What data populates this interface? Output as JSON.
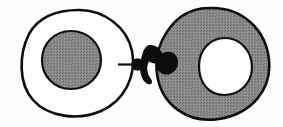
{
  "figure": {
    "title": "Two-cell conjugation diagram",
    "type": "line-drawing",
    "width": 283,
    "height": 127,
    "background_color": "#fdfdfd",
    "style": "black-ink outline drawing with dithered gray halftone fill",
    "caption": "",
    "labels": []
  },
  "colors": {
    "ink": "#1a1a1a",
    "stroke": "#111111",
    "gray_fill": "#808080",
    "gray_fill_light": "#8d8d8d",
    "white_fill": "#ffffff",
    "background": "#fdfdfd"
  },
  "shapes": {
    "left_cell": {
      "name": "left-cell-outline",
      "description": "irregular oval cell outline, white interior, thick black stroke",
      "fill": "#ffffff",
      "stroke": "#111111",
      "stroke_width": 2.6,
      "bbox": [
        22,
        9,
        113,
        107
      ],
      "path": "M 79 10 C 104 10 127 27 132 51 C 137 76 124 101 101 111 C 78 121 48 117 33 100 C 18 83 19 54 29 34 C 39 16 58 10 79 10 Z"
    },
    "left_nucleus": {
      "name": "left-nucleus",
      "description": "gray filled round nucleus inside left cell",
      "fill": "#808080",
      "stroke": "#111111",
      "stroke_width": 2.2,
      "bbox": [
        41,
        31,
        60,
        58
      ],
      "path": "M 71 31 C 88 31 101 44 101 60 C 101 76 88 89 71 89 C 54 89 42 76 42 60 C 42 44 54 31 71 31 Z"
    },
    "right_cell": {
      "name": "right-cell-outline",
      "description": "irregular oval cell, gray halftone interior, thick black stroke",
      "fill": "#808080",
      "stroke": "#111111",
      "stroke_width": 2.6,
      "bbox": [
        155,
        7,
        116,
        113
      ],
      "path": "M 212 8 C 243 8 266 30 269 60 C 272 90 251 114 219 119 C 187 124 161 104 157 74 C 153 44 173 14 199 9 C 203 8 208 8 212 8 Z"
    },
    "right_vacuole": {
      "name": "right-vacuole",
      "description": "white round vacuole inside right cell",
      "fill": "#ffffff",
      "stroke": "#111111",
      "stroke_width": 2.2,
      "bbox": [
        198,
        38,
        54,
        58
      ],
      "path": "M 225 38 C 240 38 252 51 252 67 C 252 83 240 95 224 95 C 208 95 199 82 199 66 C 199 50 210 38 225 38 Z"
    },
    "connector_lobes": {
      "name": "connector-lobes",
      "description": "solid black three-lobed conjugation bridge joining the two cells",
      "fill": "#111111",
      "bbox": [
        142,
        44,
        34,
        40
      ],
      "path": "M 148 46 C 154 44 160 49 162 56 C 164 60 163 62 160 63 C 156 64 152 63 150 61 C 147 66 148 72 152 77 C 155 82 152 85 148 83 C 142 79 141 70 143 62 C 144 55 145 49 148 46 Z M 160 56 C 168 51 176 53 176 62 C 176 71 168 76 160 72 C 156 70 155 65 156 62 C 157 59 158 57 160 56 Z"
    },
    "connector_dot": {
      "name": "connector-dot",
      "description": "small solid black dot on the left end of the bridge",
      "fill": "#111111",
      "bbox": [
        131,
        58,
        13,
        13
      ],
      "cx": 137.5,
      "cy": 64.5,
      "r": 6.2
    },
    "connector_tick": {
      "name": "connector-tick-line",
      "description": "short horizontal black tick line running left from the dot into the left cell",
      "stroke": "#111111",
      "stroke_width": 2.2,
      "x1": 118,
      "y1": 64.5,
      "x2": 133,
      "y2": 64.5
    }
  }
}
